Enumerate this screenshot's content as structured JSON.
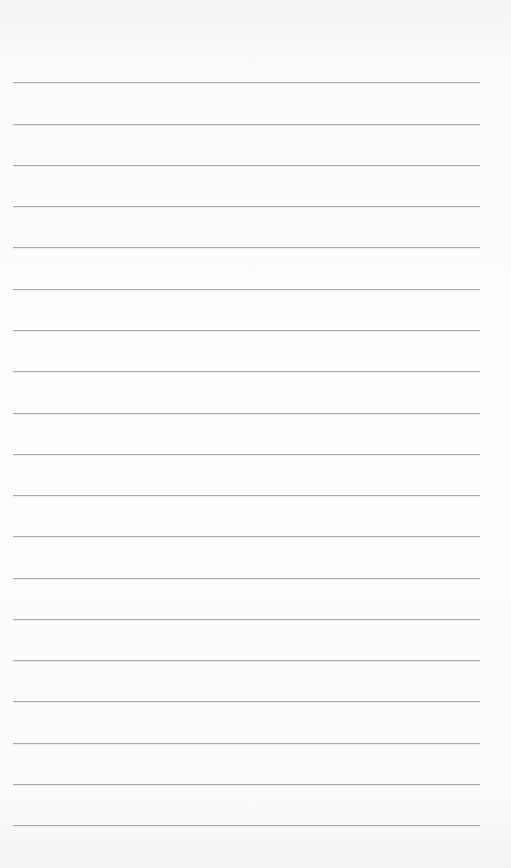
{
  "page": {
    "type": "lined-paper",
    "background_color": "#fdfdfc",
    "line_color": "#a9a9a9",
    "line_count": 19,
    "line_left": 13,
    "line_right": 480,
    "line_positions": [
      82,
      124,
      165,
      206,
      247,
      289,
      330,
      371,
      413,
      454,
      495,
      536,
      578,
      619,
      660,
      701,
      743,
      784,
      825
    ]
  }
}
